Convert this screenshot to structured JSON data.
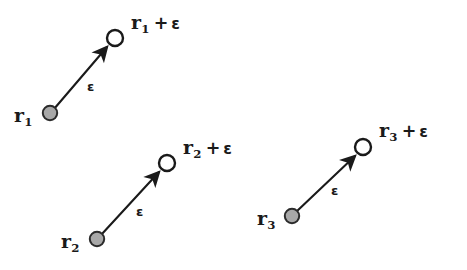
{
  "figure": {
    "background_color": "#ffffff",
    "stroke_color": "#1a1a1a",
    "filled_marker_color": "#a8a8a8",
    "open_marker_color": "#ffffff",
    "width": 467,
    "height": 270
  },
  "symbols": {
    "plus": "+",
    "epsilon": "ɛ"
  },
  "groups": [
    {
      "id": "group-1",
      "index": "1",
      "start_label": {
        "vector_name": "r",
        "subscript": "1",
        "text": "r1"
      },
      "end_label": {
        "vector_name": "r",
        "subscript": "1",
        "operator": "+",
        "operand": "ɛ",
        "text": "r1 + ɛ"
      },
      "vector_label": "ɛ",
      "start_point": {
        "x": 50,
        "y": 113
      },
      "end_point": {
        "x": 115,
        "y": 38
      },
      "marker_start_type": "filled-circle",
      "marker_end_type": "open-circle"
    },
    {
      "id": "group-2",
      "index": "2",
      "start_label": {
        "vector_name": "r",
        "subscript": "2",
        "text": "r2"
      },
      "end_label": {
        "vector_name": "r",
        "subscript": "2",
        "operator": "+",
        "operand": "ɛ",
        "text": "r2 + ɛ"
      },
      "vector_label": "ɛ",
      "start_point": {
        "x": 97,
        "y": 239
      },
      "end_point": {
        "x": 167,
        "y": 163
      },
      "marker_start_type": "filled-circle",
      "marker_end_type": "open-circle"
    },
    {
      "id": "group-3",
      "index": "3",
      "start_label": {
        "vector_name": "r",
        "subscript": "3",
        "text": "r3"
      },
      "end_label": {
        "vector_name": "r",
        "subscript": "3",
        "operator": "+",
        "operand": "ɛ",
        "text": "r3 + ɛ"
      },
      "vector_label": "ɛ",
      "start_point": {
        "x": 292,
        "y": 216
      },
      "end_point": {
        "x": 363,
        "y": 147
      },
      "marker_start_type": "filled-circle",
      "marker_end_type": "open-circle"
    }
  ]
}
